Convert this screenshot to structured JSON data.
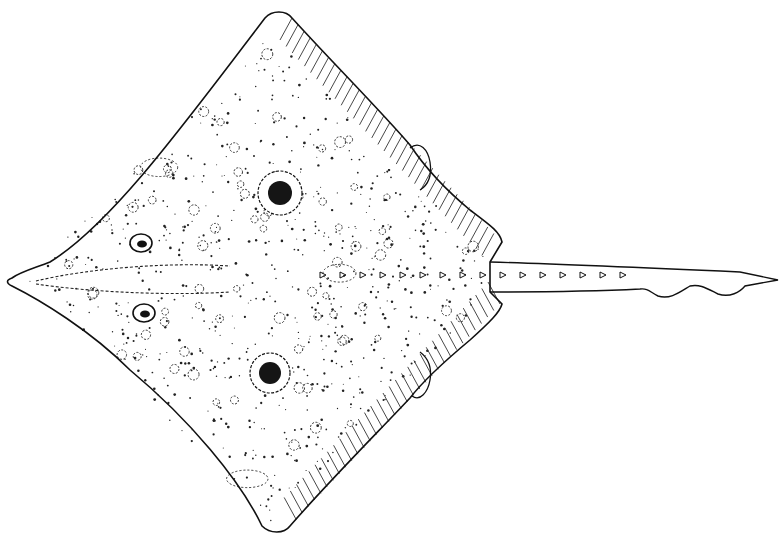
{
  "figure": {
    "background": "#ffffff",
    "ink": "#111111",
    "width": 784,
    "height": 539
  },
  "body_outline": {
    "snout": [
      12,
      278
    ],
    "left_wing_tip": [
      268,
      12
    ],
    "upper_wing_back": [
      500,
      240
    ],
    "tail_base_top": [
      490,
      262
    ],
    "tail_base_bottom": [
      490,
      290
    ],
    "lower_wing_back": [
      500,
      308
    ],
    "right_wing_tip": [
      268,
      530
    ]
  },
  "eyespots": [
    {
      "cx": 280,
      "cy": 193,
      "r_outer": 22,
      "r_inner": 12
    },
    {
      "cx": 270,
      "cy": 373,
      "r_outer": 20,
      "r_inner": 11
    }
  ],
  "eyes": [
    {
      "cx": 141,
      "cy": 243,
      "rx": 11,
      "ry": 9
    },
    {
      "cx": 144,
      "cy": 313,
      "rx": 11,
      "ry": 9
    }
  ],
  "tail": {
    "start_x": 490,
    "end": [
      778,
      280
    ],
    "thorn_count": 16
  }
}
